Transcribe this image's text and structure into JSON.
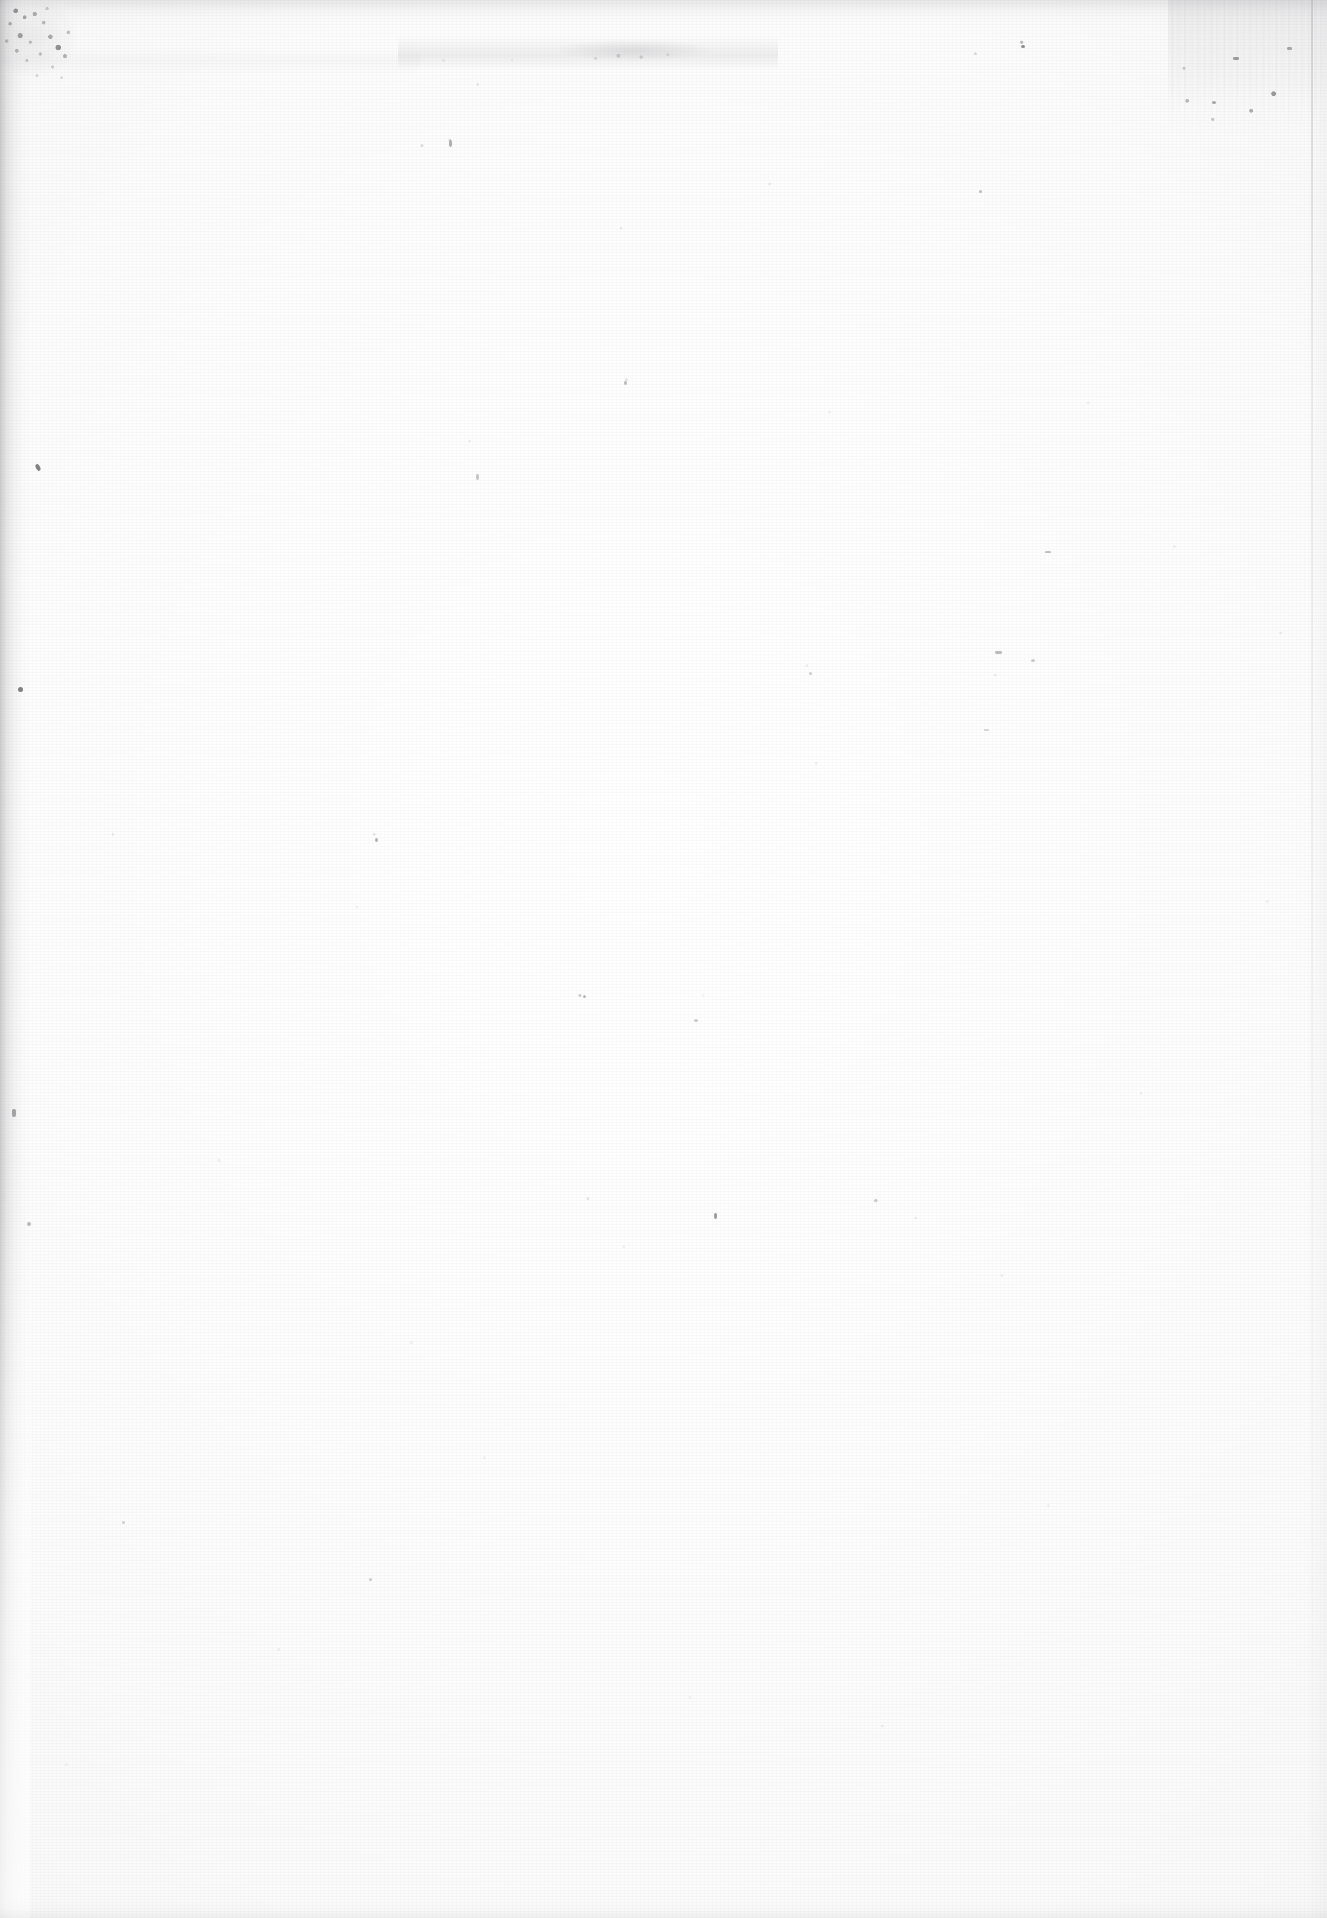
{
  "document": {
    "page_type": "scanned-blank-page",
    "visible_text": "",
    "body_text_lines": [],
    "headings": [],
    "page_number": "",
    "has_text_content": false
  },
  "canvas": {
    "width": 1327,
    "height": 1918
  },
  "colors": {
    "paper_white": "#fefefe",
    "paper_base": "#fdfdfd",
    "speck_grey": "#8a8a92",
    "dark_fleck": "#3a3a42",
    "edge_shadow": "#5a5a5f",
    "rule_grey": "#aaaab0"
  },
  "artifacts": {
    "items": [
      {
        "id": "top-left-debris-blotch",
        "label": "Dense speckled debris blotch",
        "x": 0,
        "y": 0,
        "width": 112,
        "height": 108
      },
      {
        "id": "left-edge-shadow",
        "label": "Left edge scanner shadow band",
        "x": 0,
        "y": 0,
        "width": 30,
        "height": 1918
      },
      {
        "id": "top-edge-scuff",
        "label": "Top edge scuff band",
        "x": 0,
        "y": 0,
        "width": 1327,
        "height": 26
      },
      {
        "id": "top-center-smudge",
        "label": "Horizontal smudge across top center",
        "x": 398,
        "y": 36,
        "width": 380,
        "height": 34
      },
      {
        "id": "top-right-vertical-streak",
        "label": "Faint vertical streak artifact",
        "x": 1168,
        "y": 0,
        "width": 160,
        "height": 142
      },
      {
        "id": "right-edge-rule",
        "label": "Faint vertical rule near right margin",
        "x": 1311,
        "y": 0,
        "width": 2,
        "height": 1918
      },
      {
        "id": "bottom-edge-band",
        "label": "Faint bottom edge band",
        "x": 0,
        "y": 1898,
        "width": 1327,
        "height": 20
      },
      {
        "id": "speck-field",
        "label": "Scattered dust specks across sheet",
        "x": 0,
        "y": 0,
        "width": 1327,
        "height": 1918
      }
    ]
  }
}
